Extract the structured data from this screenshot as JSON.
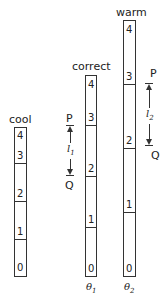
{
  "diagram": {
    "bars": [
      {
        "name": "cool",
        "label": "cool",
        "segments": [
          "4",
          "3",
          "2",
          "1",
          "0"
        ],
        "bottom_label": ""
      },
      {
        "name": "correct",
        "label": "correct",
        "segments": [
          "4",
          "3",
          "2",
          "1",
          "0"
        ],
        "bottom_label": "θ1",
        "length_marker": {
          "top": "P",
          "bottom": "Q",
          "length": "l1"
        }
      },
      {
        "name": "warm",
        "label": "warm",
        "segments": [
          "4",
          "3",
          "2",
          "1",
          "0"
        ],
        "bottom_label": "θ2",
        "length_marker": {
          "top": "P",
          "bottom": "Q",
          "length": "l2"
        }
      }
    ],
    "labels": {
      "cool": "cool",
      "correct": "correct",
      "warm": "warm",
      "theta1": "θ",
      "theta1_sub": "1",
      "theta2": "θ",
      "theta2_sub": "2",
      "p1": "P",
      "q1": "Q",
      "l1": "l",
      "l1_sub": "1",
      "p2": "P",
      "q2": "Q",
      "l2": "l",
      "l2_sub": "2",
      "d0": "0",
      "d1": "1",
      "d2": "2",
      "d3": "3",
      "d4": "4"
    }
  }
}
